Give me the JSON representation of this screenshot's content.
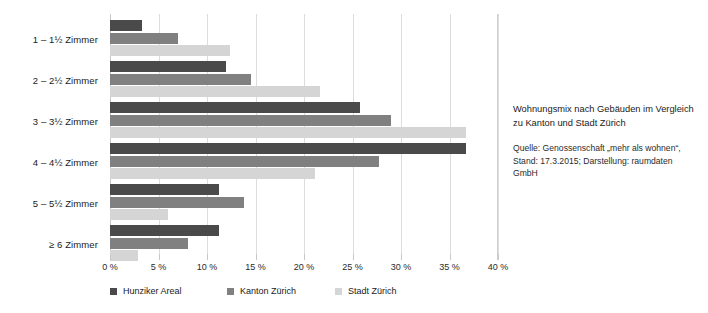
{
  "chart_data": {
    "type": "bar",
    "orientation": "horizontal",
    "title": "Wohnungsmix nach Gebäuden im Vergleich zu Kanton und Stadt Zürich",
    "source": "Quelle: Genossenschaft „mehr als wohnen“, Stand: 17.3.2015; Darstellung: raumdaten GmbH",
    "xlabel": "",
    "ylabel": "",
    "xlim": [
      0,
      40
    ],
    "xunit": "%",
    "grid": true,
    "legend_position": "bottom-left",
    "categories": [
      "1 – 1½ Zimmer",
      "2 – 2½ Zimmer",
      "3 – 3½ Zimmer",
      "4 – 4½ Zimmer",
      "5 – 5½ Zimmer",
      "≥ 6 Zimmer"
    ],
    "xticks": [
      "0 %",
      "5 %",
      "10 %",
      "15 %",
      "20 %",
      "25 %",
      "30 %",
      "35 %",
      "40 %"
    ],
    "xtick_values": [
      0,
      5,
      10,
      15,
      20,
      25,
      30,
      35,
      40
    ],
    "series": [
      {
        "name": "Hunziker Areal",
        "color": "#4a4a4a",
        "values": [
          3.3,
          12.0,
          25.8,
          36.7,
          11.2,
          11.2
        ]
      },
      {
        "name": "Kanton Zürich",
        "color": "#808080",
        "values": [
          7.0,
          14.5,
          29.0,
          27.7,
          13.8,
          8.0
        ]
      },
      {
        "name": "Stadt Zürich",
        "color": "#d5d5d5",
        "values": [
          12.4,
          21.7,
          36.7,
          21.1,
          6.0,
          2.9
        ]
      }
    ]
  },
  "sidenote": {
    "title": "Wohnungsmix nach Gebäuden im Vergleich zu Kanton und Stadt Zürich",
    "source": "Quelle: Genossenschaft „mehr als wohnen“, Stand: 17.3.2015; Darstellung: raumdaten GmbH"
  }
}
